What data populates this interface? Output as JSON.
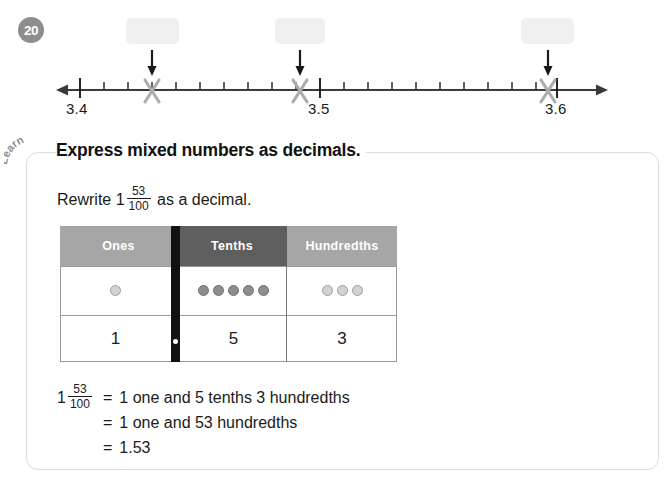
{
  "question": {
    "number": "20"
  },
  "numberline": {
    "start_label": "3.4",
    "mid_label": "3.5",
    "end_label": "3.6",
    "min": 3.4,
    "max": 3.6,
    "minor_tick_step": 0.01,
    "major_ticks": [
      "3.4",
      "3.5",
      "3.6"
    ],
    "marks": [
      {
        "name": "mark-1",
        "glyph": "✕",
        "approx_value": "3.43"
      },
      {
        "name": "mark-2",
        "glyph": "✕",
        "approx_value": "3.49"
      },
      {
        "name": "mark-3",
        "glyph": "✕",
        "approx_value": "3.59"
      }
    ],
    "answer_boxes": [
      {
        "name": "answer-box-1",
        "value": ""
      },
      {
        "name": "answer-box-2",
        "value": ""
      },
      {
        "name": "answer-box-3",
        "value": ""
      }
    ]
  },
  "learn": {
    "badge_label": "Learn",
    "heading": "Express mixed numbers as decimals.",
    "prompt": {
      "prefix": "Rewrite",
      "whole": "1",
      "numerator": "53",
      "denominator": "100",
      "suffix": "as a decimal."
    }
  },
  "place_value_table": {
    "headers": [
      "Ones",
      "Tenths",
      "Hundredths"
    ],
    "header_colors": [
      "#a6a6a6",
      "#5e5e5e",
      "#a6a6a6"
    ],
    "counters": {
      "ones": 1,
      "tenths": 5,
      "hundredths": 3
    },
    "digits": {
      "ones": "1",
      "tenths": "5",
      "hundredths": "3"
    },
    "decimal_point": "."
  },
  "answers": {
    "lead": {
      "whole": "1",
      "numerator": "53",
      "denominator": "100"
    },
    "equals": "=",
    "line1": "1 one and 5 tenths 3 hundredths",
    "line2": "1 one and 53 hundredths",
    "line3": "1.53"
  }
}
